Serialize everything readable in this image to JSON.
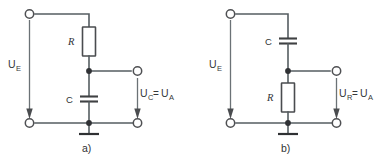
{
  "figure": {
    "background_color": "#ffffff",
    "wire_color": "#555d61",
    "label_color": "#36383a"
  },
  "circuits": [
    {
      "id": "circuit-a",
      "panel_label": "a)",
      "topology": "RC low-pass filter",
      "input_label": {
        "symbol": "U",
        "subscript": "E"
      },
      "output_label": {
        "left_symbol": "U",
        "left_subscript": "C",
        "relation": "=",
        "right_symbol": "U",
        "right_subscript": "A"
      },
      "components": [
        {
          "name": "resistor",
          "label": "R",
          "orientation": "vertical",
          "branch": "series-top"
        },
        {
          "name": "capacitor",
          "label": "C",
          "orientation": "vertical",
          "branch": "shunt"
        }
      ],
      "terminals": [
        {
          "name": "input-top",
          "type": "open-circle"
        },
        {
          "name": "input-bottom",
          "type": "open-circle"
        },
        {
          "name": "output-top",
          "type": "open-circle"
        },
        {
          "name": "output-bottom",
          "type": "open-circle"
        }
      ],
      "ground": {
        "name": "ground-symbol",
        "present": true
      }
    },
    {
      "id": "circuit-b",
      "panel_label": "b)",
      "topology": "RC high-pass filter",
      "input_label": {
        "symbol": "U",
        "subscript": "E"
      },
      "output_label": {
        "left_symbol": "U",
        "left_subscript": "R",
        "relation": "=",
        "right_symbol": "U",
        "right_subscript": "A"
      },
      "components": [
        {
          "name": "capacitor",
          "label": "C",
          "orientation": "vertical",
          "branch": "series-top"
        },
        {
          "name": "resistor",
          "label": "R",
          "orientation": "vertical",
          "branch": "shunt"
        }
      ],
      "terminals": [
        {
          "name": "input-top",
          "type": "open-circle"
        },
        {
          "name": "input-bottom",
          "type": "open-circle"
        },
        {
          "name": "output-top",
          "type": "open-circle"
        },
        {
          "name": "output-bottom",
          "type": "open-circle"
        }
      ],
      "ground": {
        "name": "ground-symbol",
        "present": true
      }
    }
  ]
}
